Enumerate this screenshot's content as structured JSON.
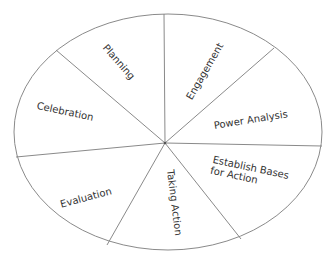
{
  "diagram": {
    "type": "cycle-wheel",
    "style": {
      "stroke": "#8a8a8a",
      "text": "#333333",
      "background": "#ffffff"
    },
    "segments": [
      {
        "id": "planning",
        "label": "Planning"
      },
      {
        "id": "engagement",
        "label": "Engagement"
      },
      {
        "id": "power-analysis",
        "label": "Power Analysis"
      },
      {
        "id": "establish-bases",
        "label": "Establish Bases for Action"
      },
      {
        "id": "taking-action",
        "label": "Taking Action"
      },
      {
        "id": "evaluation",
        "label": "Evaluation"
      },
      {
        "id": "celebration",
        "label": "Celebration"
      }
    ]
  }
}
